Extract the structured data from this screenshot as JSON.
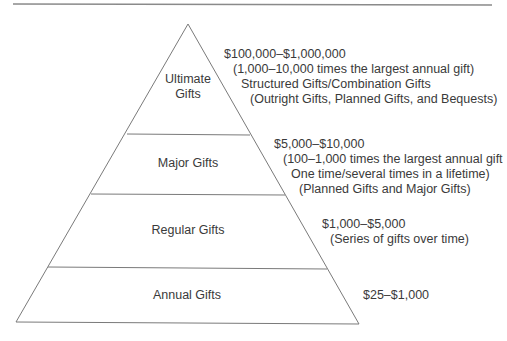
{
  "diagram": {
    "type": "pyramid",
    "colors": {
      "line": "#7a7a7a",
      "text": "#3a3a3a",
      "background": "#ffffff"
    },
    "tiers": [
      {
        "name": "Ultimate Gifts",
        "label_line1": "Ultimate",
        "label_line2": "Gifts",
        "range": "$100,000–$1,000,000",
        "details": [
          "(1,000–10,000 times the largest annual gift)",
          "Structured Gifts/Combination Gifts",
          "(Outright Gifts, Planned Gifts, and Bequests)"
        ]
      },
      {
        "name": "Major Gifts",
        "label_line1": "Major Gifts",
        "range": "$5,000–$10,000",
        "details": [
          "(100–1,000 times the largest annual gift",
          "One time/several times in a lifetime)",
          "(Planned Gifts and Major Gifts)"
        ]
      },
      {
        "name": "Regular Gifts",
        "label_line1": "Regular Gifts",
        "range": "$1,000–$5,000",
        "details": [
          "(Series of gifts over time)"
        ]
      },
      {
        "name": "Annual Gifts",
        "label_line1": "Annual Gifts",
        "range": "$25–$1,000",
        "details": []
      }
    ]
  }
}
